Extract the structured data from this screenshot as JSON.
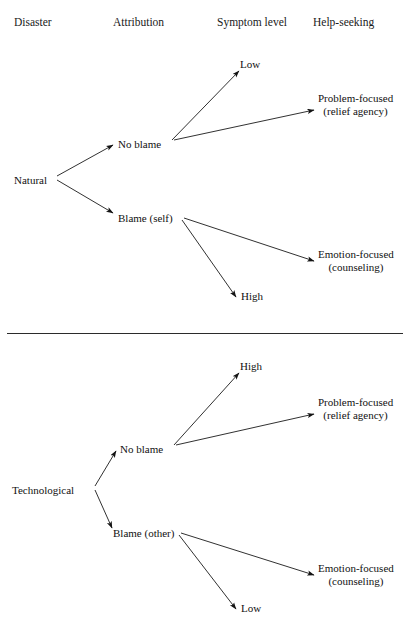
{
  "figure": {
    "type": "diagram",
    "subtype": "tree-flow",
    "orientation": "left-to-right",
    "panels": 2,
    "divider": {
      "present": true,
      "y": 333,
      "color": "#2b2b2b"
    },
    "line_color": "#1a1a1a",
    "text_color": "#111111",
    "background": "#ffffff"
  },
  "columns": [
    {
      "key": "disaster",
      "label": "Disaster",
      "x": 14
    },
    {
      "key": "attribution",
      "label": "Attribution",
      "x": 113
    },
    {
      "key": "symptom_level",
      "label": "Symptom level",
      "x": 217
    },
    {
      "key": "help_seeking",
      "label": "Help-seeking",
      "x": 313
    }
  ],
  "panels": [
    {
      "id": "natural",
      "root": {
        "label": "Natural",
        "x": 14,
        "y": 174,
        "column": "disaster"
      },
      "attributions": [
        {
          "id": "no-blame",
          "label": "No blame",
          "x": 118,
          "y": 138,
          "column": "attribution"
        },
        {
          "id": "blame-self",
          "label": "Blame (self)",
          "x": 118,
          "y": 212,
          "column": "attribution"
        }
      ],
      "symptoms": [
        {
          "id": "low",
          "label": "Low",
          "x": 240,
          "y": 58,
          "column": "symptom_level",
          "from": "no-blame"
        },
        {
          "id": "high",
          "label": "High",
          "x": 241,
          "y": 290,
          "column": "symptom_level",
          "from": "blame-self"
        }
      ],
      "coping": [
        {
          "id": "problem-focused",
          "line1": "Problem-focused",
          "line2": "(relief agency)",
          "x": 318,
          "y": 92,
          "column": "help_seeking",
          "from": "no-blame"
        },
        {
          "id": "emotion-focused",
          "line1": "Emotion-focused",
          "line2": "(counseling)",
          "x": 318,
          "y": 248,
          "column": "help_seeking",
          "from": "blame-self"
        }
      ]
    },
    {
      "id": "technological",
      "root": {
        "label": "Technological",
        "x": 12,
        "y": 484,
        "column": "disaster"
      },
      "attributions": [
        {
          "id": "no-blame-2",
          "label": "No blame",
          "x": 120,
          "y": 443,
          "column": "attribution"
        },
        {
          "id": "blame-other",
          "label": "Blame (other)",
          "x": 113,
          "y": 527,
          "column": "attribution"
        }
      ],
      "symptoms": [
        {
          "id": "high-2",
          "label": "High",
          "x": 240,
          "y": 360,
          "column": "symptom_level",
          "from": "no-blame-2"
        },
        {
          "id": "low-2",
          "label": "Low",
          "x": 241,
          "y": 602,
          "column": "symptom_level",
          "from": "blame-other"
        }
      ],
      "coping": [
        {
          "id": "problem-focused-2",
          "line1": "Problem-focused",
          "line2": "(relief agency)",
          "x": 318,
          "y": 396,
          "column": "help_seeking",
          "from": "no-blame-2"
        },
        {
          "id": "emotion-focused-2",
          "line1": "Emotion-focused",
          "line2": "(counseling)",
          "x": 318,
          "y": 562,
          "column": "help_seeking",
          "from": "blame-other"
        }
      ]
    }
  ],
  "artifact": {
    "top_partial_text": "",
    "note": ""
  }
}
